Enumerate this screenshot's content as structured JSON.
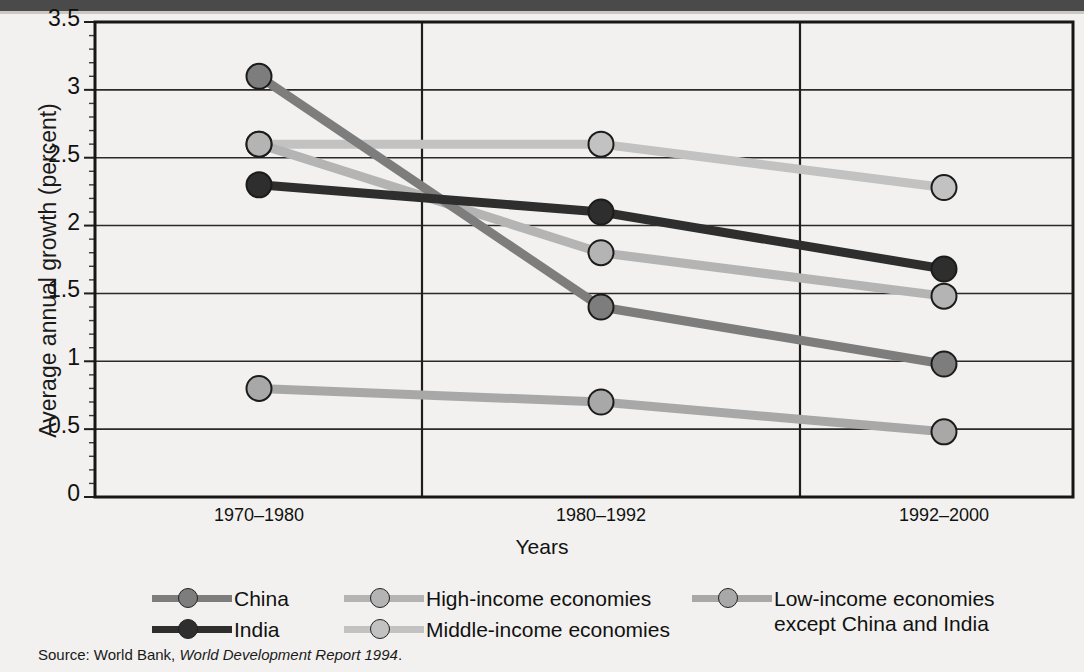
{
  "figure": {
    "top_band_color": "#4a4a4a",
    "background_color": "#f2f1ef"
  },
  "source": {
    "prefix": "Source: World Bank, ",
    "italic": "World Development Report 1994",
    "suffix": "."
  },
  "chart_data": {
    "type": "line",
    "title": "",
    "xlabel": "Years",
    "ylabel": "Average annual growth (percent)",
    "categories": [
      "1970–1980",
      "1980–1992",
      "1992–2000"
    ],
    "ylim": [
      0,
      3.5
    ],
    "yticks": [
      "0",
      "0.5",
      "1",
      "1.5",
      "2",
      "2.5",
      "3",
      "3.5"
    ],
    "ytick_values": [
      0,
      0.5,
      1,
      1.5,
      2,
      2.5,
      3,
      3.5
    ],
    "minor_tick_step": 0.1,
    "grid": "both",
    "legend_position": "below",
    "series": [
      {
        "name": "China",
        "color": "#7d7d7d",
        "values": [
          3.1,
          1.4,
          0.98
        ]
      },
      {
        "name": "India",
        "color": "#2e2e2e",
        "values": [
          2.3,
          2.1,
          1.68
        ]
      },
      {
        "name": "High-income economies",
        "color": "#b4b4b4",
        "values": [
          2.6,
          1.8,
          1.48
        ]
      },
      {
        "name": "Middle-income economies",
        "color": "#c2c2c2",
        "values": [
          2.6,
          2.6,
          2.28
        ]
      },
      {
        "name": "Low-income economies\nexcept China and India",
        "color": "#a8a8a8",
        "values": [
          0.8,
          0.7,
          0.48
        ]
      }
    ]
  },
  "legend": {
    "columns": [
      {
        "left": 0,
        "items": [
          {
            "label": "China",
            "series": 0
          },
          {
            "label": "India",
            "series": 1
          }
        ]
      },
      {
        "left": 192,
        "items": [
          {
            "label": "High-income economies",
            "series": 2
          },
          {
            "label": "Middle-income economies",
            "series": 3
          }
        ]
      },
      {
        "left": 540,
        "items": [
          {
            "label": "Low-income economies\nexcept China and India",
            "series": 4
          }
        ]
      }
    ]
  }
}
